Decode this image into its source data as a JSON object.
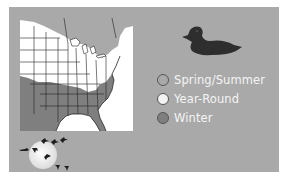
{
  "map": {
    "region": "Eastern United States",
    "colors": {
      "spring_summer": "#a9a9a9",
      "year_round": "#ffffff",
      "winter": "#7f7f7f",
      "ocean": "#ffffff",
      "border": "#222222"
    }
  },
  "species_icon": "duck-silhouette-icon",
  "legend": {
    "items": [
      {
        "label": "Spring/Summer",
        "color": "#a9a9a9"
      },
      {
        "label": "Year-Round",
        "color": "#f2f2f2"
      },
      {
        "label": "Winter",
        "color": "#7f7f7f"
      }
    ]
  },
  "migration_icon": "moon-with-flying-birds-icon",
  "colors": {
    "panel": "#a9a9a9",
    "legend_text": "#f4f4f4",
    "page_background": "#ffffff"
  }
}
